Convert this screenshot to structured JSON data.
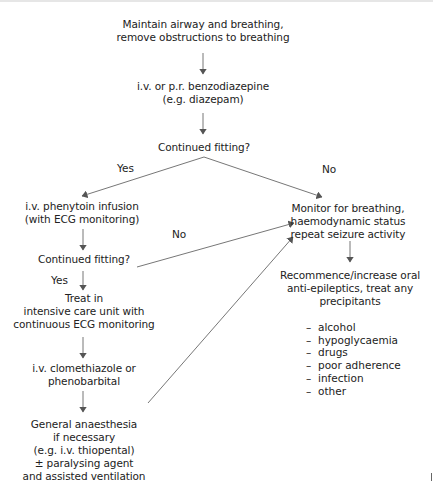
{
  "nodes": {
    "start": {
      "lines": [
        "Maintain airway and breathing,",
        "remove obstructions to breathing"
      ]
    },
    "benzo": {
      "lines": [
        "i.v. or p.r. benzodiazepine",
        "(e.g. diazepam)"
      ]
    },
    "decision1": {
      "lines": [
        "Continued fitting?"
      ]
    },
    "phenytoin": {
      "lines": [
        "i.v. phenytoin infusion",
        "(with ECG monitoring)"
      ]
    },
    "monitor": {
      "lines": [
        "Monitor for breathing,",
        "haemodynamic status",
        "repeat seizure activity"
      ]
    },
    "decision2": {
      "lines": [
        "Continued fitting?"
      ]
    },
    "icu": {
      "lines": [
        "Treat in",
        "intensive care unit with",
        "continuous ECG monitoring"
      ]
    },
    "recommence": {
      "lines": [
        "Recommence/increase oral",
        "anti-epileptics, treat any",
        "precipitants"
      ]
    },
    "clomethiazole": {
      "lines": [
        "i.v. clomethiazole or",
        "phenobarbital"
      ]
    },
    "anaesthesia": {
      "lines": [
        "General anaesthesia",
        "if necessary",
        "(e.g. i.v. thiopental)",
        "± paralysing agent",
        "and assisted ventilation"
      ]
    }
  },
  "edge_labels": {
    "yes1": "Yes",
    "no1": "No",
    "no2": "No",
    "yes2": "Yes"
  },
  "precipitants": {
    "dash": "–",
    "items": [
      "alcohol",
      "hypoglycaemia",
      "drugs",
      "poor adherence",
      "infection",
      "other"
    ]
  },
  "colors": {
    "text": "#222222",
    "arrow": "#555555",
    "line": "#777777"
  }
}
